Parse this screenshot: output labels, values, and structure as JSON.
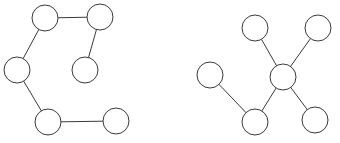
{
  "figure": {
    "background_color": "#ffffff",
    "node_fill_color": "#ffffff",
    "node_stroke_color": "#3a3a3a",
    "edge_color": "#3a3a3a",
    "edge_width": 1,
    "node_radius": 13,
    "width": 340,
    "height": 143
  },
  "chart_data": {
    "type": "diagram",
    "subtype": "node-link-graph",
    "xlabel": "",
    "ylabel": "",
    "grid": false,
    "legend": "none",
    "graphs": [
      {
        "id": "graph-left",
        "name": "left-graph",
        "layout": "path-chain",
        "node_count": 6,
        "edge_count": 5,
        "nodes": [
          {
            "id": "L1",
            "label": "",
            "cx": 45,
            "cy": 18,
            "r": 13,
            "degree": 2
          },
          {
            "id": "L2",
            "label": "",
            "cx": 100,
            "cy": 17,
            "r": 13,
            "degree": 2
          },
          {
            "id": "L3",
            "label": "",
            "cx": 17,
            "cy": 70,
            "r": 13,
            "degree": 2
          },
          {
            "id": "L4",
            "label": "",
            "cx": 85,
            "cy": 70,
            "r": 13,
            "degree": 1
          },
          {
            "id": "L5",
            "label": "",
            "cx": 48,
            "cy": 122,
            "r": 13,
            "degree": 2
          },
          {
            "id": "L6",
            "label": "",
            "cx": 116,
            "cy": 121,
            "r": 13,
            "degree": 1
          }
        ],
        "edges": [
          {
            "id": "LE1",
            "source": "L1",
            "target": "L2"
          },
          {
            "id": "LE2",
            "source": "L1",
            "target": "L3"
          },
          {
            "id": "LE3",
            "source": "L2",
            "target": "L4"
          },
          {
            "id": "LE4",
            "source": "L3",
            "target": "L5"
          },
          {
            "id": "LE5",
            "source": "L5",
            "target": "L6"
          }
        ]
      },
      {
        "id": "graph-right",
        "name": "right-graph",
        "layout": "star-hub",
        "node_count": 6,
        "edge_count": 5,
        "hub_node": "R3",
        "nodes": [
          {
            "id": "R1",
            "label": "",
            "cx": 255,
            "cy": 28,
            "r": 13,
            "degree": 1
          },
          {
            "id": "R2",
            "label": "",
            "cx": 318,
            "cy": 28,
            "r": 13,
            "degree": 1
          },
          {
            "id": "R3",
            "label": "",
            "cx": 283,
            "cy": 77,
            "r": 13,
            "degree": 4
          },
          {
            "id": "R4",
            "label": "",
            "cx": 210,
            "cy": 75,
            "r": 13,
            "degree": 1
          },
          {
            "id": "R5",
            "label": "",
            "cx": 255,
            "cy": 122,
            "r": 13,
            "degree": 2
          },
          {
            "id": "R6",
            "label": "",
            "cx": 315,
            "cy": 120,
            "r": 13,
            "degree": 1
          }
        ],
        "edges": [
          {
            "id": "RE1",
            "source": "R1",
            "target": "R3"
          },
          {
            "id": "RE2",
            "source": "R2",
            "target": "R3"
          },
          {
            "id": "RE3",
            "source": "R3",
            "target": "R5"
          },
          {
            "id": "RE4",
            "source": "R3",
            "target": "R6"
          },
          {
            "id": "RE5",
            "source": "R4",
            "target": "R5"
          }
        ]
      }
    ]
  }
}
